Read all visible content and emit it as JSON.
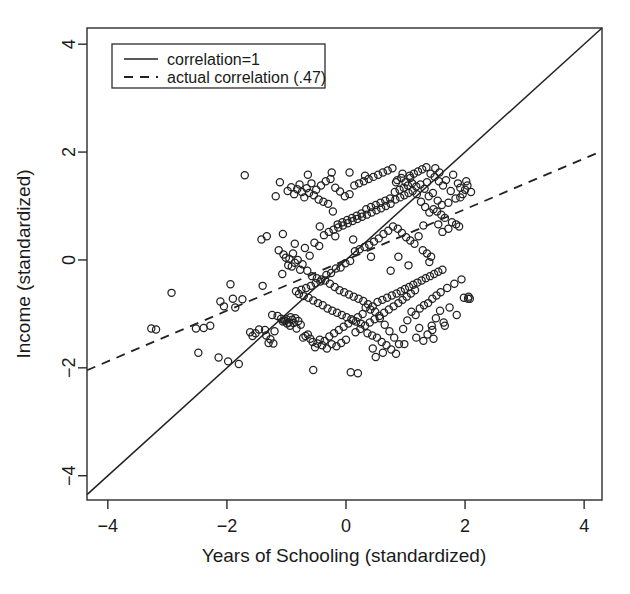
{
  "chart_data": {
    "type": "scatter",
    "title": "",
    "xlabel": "Years of Schooling (standardized)",
    "ylabel": "Income (standardized)",
    "xlim": [
      -4.35,
      4.3
    ],
    "ylim": [
      -4.45,
      4.3
    ],
    "xticks": [
      -4,
      -2,
      0,
      2,
      4
    ],
    "yticks": [
      -4,
      -2,
      0,
      2,
      4
    ],
    "xtick_labels": [
      "−4",
      "−2",
      "0",
      "2",
      "4"
    ],
    "ytick_labels": [
      "−4",
      "−2",
      "0",
      "2",
      "4"
    ],
    "grid": false,
    "legend_position": "top-left",
    "marker": "open-circle",
    "marker_radius": 3.6,
    "point_color": "#222222",
    "n_points": 332,
    "correlation": 0.47,
    "legend": [
      {
        "label": "correlation=1",
        "style": "solid",
        "slope": 1,
        "intercept": 0
      },
      {
        "label": "actual correlation (.47)",
        "style": "dashed",
        "slope": 0.47,
        "intercept": 0
      }
    ],
    "reference_lines": [
      {
        "name": "identity-line",
        "style": "solid",
        "slope": 1,
        "intercept": 0,
        "x_from": -4.35,
        "x_to": 4.3
      },
      {
        "name": "regression-line",
        "style": "dashed",
        "slope": 0.47,
        "intercept": 0,
        "x_from": -4.35,
        "x_to": 4.3
      }
    ],
    "points": [
      [
        -3.27,
        -1.27
      ],
      [
        -3.19,
        -1.29
      ],
      [
        -2.93,
        -0.61
      ],
      [
        -2.52,
        -1.27
      ],
      [
        -2.48,
        -1.72
      ],
      [
        -2.39,
        -1.26
      ],
      [
        -2.28,
        -1.22
      ],
      [
        -2.14,
        -1.81
      ],
      [
        -2.11,
        -0.77
      ],
      [
        -2.05,
        -0.86
      ],
      [
        -1.98,
        -1.88
      ],
      [
        -1.94,
        -0.45
      ],
      [
        -1.9,
        -0.72
      ],
      [
        -1.86,
        -0.88
      ],
      [
        -1.8,
        -1.93
      ],
      [
        -1.74,
        -0.73
      ],
      [
        -1.7,
        1.57
      ],
      [
        -1.61,
        -1.34
      ],
      [
        -1.57,
        -1.41
      ],
      [
        -1.52,
        -1.36
      ],
      [
        -1.46,
        -1.29
      ],
      [
        -1.42,
        0.38
      ],
      [
        -1.4,
        -0.48
      ],
      [
        -1.36,
        -1.3
      ],
      [
        -1.34,
        -1.4
      ],
      [
        -1.33,
        0.44
      ],
      [
        -1.3,
        -1.54
      ],
      [
        -1.27,
        -1.47
      ],
      [
        -1.24,
        -1.02
      ],
      [
        -1.22,
        -1.55
      ],
      [
        -1.2,
        -1.32
      ],
      [
        -1.18,
        1.18
      ],
      [
        -1.15,
        -1.04
      ],
      [
        -1.13,
        0.18
      ],
      [
        -1.11,
        1.44
      ],
      [
        -1.09,
        -1.09
      ],
      [
        -1.07,
        -0.26
      ],
      [
        -1.06,
        -1.14
      ],
      [
        -1.05,
        0.1
      ],
      [
        -1.04,
        -1.12
      ],
      [
        -1.02,
        -1.13
      ],
      [
        -1.01,
        0.04
      ],
      [
        -1.0,
        -1.1
      ],
      [
        -0.99,
        -1.18
      ],
      [
        -0.98,
        1.28
      ],
      [
        -0.97,
        -0.1
      ],
      [
        -0.96,
        -1.16
      ],
      [
        -0.95,
        0.02
      ],
      [
        -0.94,
        -1.22
      ],
      [
        -0.93,
        -1.06
      ],
      [
        -0.92,
        1.35
      ],
      [
        -0.91,
        -0.12
      ],
      [
        -0.9,
        -1.11
      ],
      [
        -0.89,
        0.12
      ],
      [
        -0.88,
        -1.17
      ],
      [
        -0.87,
        1.22
      ],
      [
        -0.86,
        -0.05
      ],
      [
        -0.85,
        -1.08
      ],
      [
        -0.84,
        -0.58
      ],
      [
        -0.83,
        -1.27
      ],
      [
        -0.82,
        1.31
      ],
      [
        -0.81,
        0.0
      ],
      [
        -0.8,
        -1.13
      ],
      [
        -0.79,
        -0.63
      ],
      [
        -0.78,
        1.4
      ],
      [
        -0.77,
        -0.18
      ],
      [
        -0.76,
        -1.2
      ],
      [
        -0.75,
        -0.55
      ],
      [
        -0.74,
        1.26
      ],
      [
        -0.73,
        -0.08
      ],
      [
        -0.72,
        -1.44
      ],
      [
        -0.71,
        -0.67
      ],
      [
        -0.7,
        1.16
      ],
      [
        -0.69,
        0.22
      ],
      [
        -0.68,
        -1.41
      ],
      [
        -0.67,
        -0.52
      ],
      [
        -0.66,
        1.33
      ],
      [
        -0.65,
        -0.2
      ],
      [
        -0.64,
        -1.38
      ],
      [
        -0.63,
        -0.7
      ],
      [
        -0.62,
        1.24
      ],
      [
        -0.61,
        0.08
      ],
      [
        -0.6,
        -1.46
      ],
      [
        -0.59,
        -0.48
      ],
      [
        -0.58,
        1.42
      ],
      [
        -0.57,
        -0.3
      ],
      [
        -0.56,
        -1.52
      ],
      [
        -0.55,
        -0.75
      ],
      [
        -0.54,
        1.2
      ],
      [
        -0.53,
        0.32
      ],
      [
        -0.52,
        -1.62
      ],
      [
        -0.51,
        -0.43
      ],
      [
        -0.5,
        1.3
      ],
      [
        -0.49,
        -0.34
      ],
      [
        -0.48,
        -1.55
      ],
      [
        -0.47,
        -0.8
      ],
      [
        -0.46,
        1.12
      ],
      [
        -0.45,
        0.26
      ],
      [
        -0.44,
        -1.48
      ],
      [
        -0.43,
        -0.4
      ],
      [
        -0.42,
        1.38
      ],
      [
        -0.41,
        -0.36
      ],
      [
        -0.4,
        -1.58
      ],
      [
        -0.39,
        -0.84
      ],
      [
        -0.38,
        1.08
      ],
      [
        -0.37,
        0.46
      ],
      [
        -0.36,
        -1.5
      ],
      [
        -0.35,
        -0.38
      ],
      [
        -0.34,
        1.46
      ],
      [
        -0.33,
        -0.28
      ],
      [
        -0.32,
        -1.64
      ],
      [
        -0.31,
        -0.9
      ],
      [
        -0.3,
        1.04
      ],
      [
        -0.29,
        0.52
      ],
      [
        -0.28,
        -1.42
      ],
      [
        -0.27,
        -0.44
      ],
      [
        -0.26,
        1.5
      ],
      [
        -0.25,
        -0.24
      ],
      [
        -0.24,
        -1.56
      ],
      [
        -0.23,
        -0.94
      ],
      [
        -0.22,
        0.9
      ],
      [
        -0.21,
        0.56
      ],
      [
        -0.2,
        -1.36
      ],
      [
        -0.19,
        -0.5
      ],
      [
        -0.18,
        1.34
      ],
      [
        -0.17,
        -0.16
      ],
      [
        -0.16,
        -1.6
      ],
      [
        -0.15,
        -0.98
      ],
      [
        -0.14,
        0.66
      ],
      [
        -0.13,
        0.6
      ],
      [
        -0.12,
        -1.3
      ],
      [
        -0.11,
        -0.56
      ],
      [
        -0.1,
        1.27
      ],
      [
        -0.09,
        -0.14
      ],
      [
        -0.08,
        -1.54
      ],
      [
        -0.07,
        -1.02
      ],
      [
        -0.06,
        0.7
      ],
      [
        -0.05,
        0.64
      ],
      [
        -0.04,
        -1.24
      ],
      [
        -0.03,
        -0.6
      ],
      [
        -0.02,
        1.18
      ],
      [
        -0.01,
        -0.06
      ],
      [
        0.0,
        -1.48
      ],
      [
        0.01,
        -1.06
      ],
      [
        0.02,
        0.74
      ],
      [
        0.03,
        0.68
      ],
      [
        0.04,
        -1.18
      ],
      [
        0.05,
        -0.64
      ],
      [
        0.06,
        1.22
      ],
      [
        0.07,
        -0.02
      ],
      [
        0.08,
        -2.08
      ],
      [
        0.09,
        -1.1
      ],
      [
        0.1,
        0.78
      ],
      [
        0.11,
        0.72
      ],
      [
        0.12,
        -1.12
      ],
      [
        0.13,
        -0.68
      ],
      [
        0.14,
        1.38
      ],
      [
        0.15,
        0.16
      ],
      [
        0.16,
        -1.34
      ],
      [
        0.17,
        -1.14
      ],
      [
        0.18,
        0.82
      ],
      [
        0.19,
        0.76
      ],
      [
        0.2,
        -1.06
      ],
      [
        0.21,
        -0.72
      ],
      [
        0.22,
        1.42
      ],
      [
        0.23,
        0.2
      ],
      [
        0.24,
        -1.28
      ],
      [
        0.25,
        -1.18
      ],
      [
        0.26,
        0.86
      ],
      [
        0.27,
        0.8
      ],
      [
        0.28,
        -1.0
      ],
      [
        0.29,
        -0.76
      ],
      [
        0.3,
        1.46
      ],
      [
        0.31,
        0.24
      ],
      [
        0.32,
        -1.22
      ],
      [
        0.33,
        -0.88
      ],
      [
        0.34,
        0.94
      ],
      [
        0.35,
        0.84
      ],
      [
        0.36,
        -1.36
      ],
      [
        0.37,
        -0.82
      ],
      [
        0.38,
        1.5
      ],
      [
        0.39,
        0.28
      ],
      [
        0.4,
        -1.16
      ],
      [
        0.41,
        -0.92
      ],
      [
        0.42,
        0.98
      ],
      [
        0.43,
        0.88
      ],
      [
        0.44,
        -1.4
      ],
      [
        0.45,
        -0.86
      ],
      [
        0.46,
        1.54
      ],
      [
        0.47,
        0.34
      ],
      [
        0.48,
        -1.1
      ],
      [
        0.49,
        -0.96
      ],
      [
        0.5,
        1.02
      ],
      [
        0.51,
        0.92
      ],
      [
        0.52,
        -1.44
      ],
      [
        0.53,
        -0.78
      ],
      [
        0.54,
        1.58
      ],
      [
        0.55,
        0.4
      ],
      [
        0.56,
        -1.04
      ],
      [
        0.57,
        -1.08
      ],
      [
        0.58,
        1.06
      ],
      [
        0.59,
        0.96
      ],
      [
        0.6,
        -1.52
      ],
      [
        0.61,
        -0.74
      ],
      [
        0.62,
        1.62
      ],
      [
        0.63,
        0.48
      ],
      [
        0.64,
        -0.98
      ],
      [
        0.65,
        -1.2
      ],
      [
        0.66,
        1.1
      ],
      [
        0.67,
        1.0
      ],
      [
        0.68,
        -1.58
      ],
      [
        0.69,
        -0.7
      ],
      [
        0.7,
        1.66
      ],
      [
        0.71,
        0.54
      ],
      [
        0.72,
        -0.92
      ],
      [
        0.73,
        -1.32
      ],
      [
        0.74,
        1.14
      ],
      [
        0.75,
        1.04
      ],
      [
        0.76,
        -1.66
      ],
      [
        0.77,
        -0.66
      ],
      [
        0.78,
        1.7
      ],
      [
        0.79,
        0.62
      ],
      [
        0.8,
        -0.86
      ],
      [
        0.81,
        -1.44
      ],
      [
        0.82,
        1.26
      ],
      [
        0.83,
        1.12
      ],
      [
        0.84,
        -1.74
      ],
      [
        0.85,
        -0.62
      ],
      [
        0.86,
        1.48
      ],
      [
        0.87,
        0.58
      ],
      [
        0.88,
        -0.8
      ],
      [
        0.89,
        -1.56
      ],
      [
        0.9,
        1.3
      ],
      [
        0.91,
        1.16
      ],
      [
        0.92,
        -0.58
      ],
      [
        0.93,
        1.52
      ],
      [
        0.94,
        0.5
      ],
      [
        0.95,
        -0.74
      ],
      [
        0.96,
        -1.28
      ],
      [
        0.97,
        1.34
      ],
      [
        0.98,
        1.2
      ],
      [
        0.99,
        -0.54
      ],
      [
        1.0,
        1.44
      ],
      [
        1.01,
        0.42
      ],
      [
        1.02,
        -0.68
      ],
      [
        1.03,
        -1.12
      ],
      [
        1.04,
        1.38
      ],
      [
        1.05,
        1.24
      ],
      [
        1.06,
        -0.5
      ],
      [
        1.07,
        1.56
      ],
      [
        1.08,
        0.36
      ],
      [
        1.09,
        -0.62
      ],
      [
        1.1,
        -0.96
      ],
      [
        1.11,
        1.42
      ],
      [
        1.12,
        1.28
      ],
      [
        1.13,
        -0.46
      ],
      [
        1.14,
        1.6
      ],
      [
        1.15,
        0.3
      ],
      [
        1.16,
        -0.56
      ],
      [
        1.17,
        -1.02
      ],
      [
        1.18,
        1.36
      ],
      [
        1.19,
        1.22
      ],
      [
        1.2,
        -0.42
      ],
      [
        1.21,
        1.64
      ],
      [
        1.22,
        0.44
      ],
      [
        1.23,
        -1.26
      ],
      [
        1.24,
        -0.9
      ],
      [
        1.25,
        1.4
      ],
      [
        1.26,
        1.08
      ],
      [
        1.27,
        -0.38
      ],
      [
        1.28,
        1.68
      ],
      [
        1.29,
        0.18
      ],
      [
        1.3,
        -1.5
      ],
      [
        1.31,
        -0.84
      ],
      [
        1.32,
        1.32
      ],
      [
        1.33,
        0.98
      ],
      [
        1.34,
        -0.34
      ],
      [
        1.35,
        1.72
      ],
      [
        1.36,
        0.12
      ],
      [
        1.37,
        -1.38
      ],
      [
        1.38,
        -0.8
      ],
      [
        1.39,
        1.18
      ],
      [
        1.4,
        0.88
      ],
      [
        1.41,
        -0.3
      ],
      [
        1.42,
        1.6
      ],
      [
        1.43,
        0.06
      ],
      [
        1.44,
        -1.22
      ],
      [
        1.45,
        -0.72
      ],
      [
        1.46,
        1.24
      ],
      [
        1.47,
        0.94
      ],
      [
        1.48,
        -0.26
      ],
      [
        1.49,
        1.54
      ],
      [
        1.5,
        1.7
      ],
      [
        1.51,
        -1.08
      ],
      [
        1.52,
        -0.66
      ],
      [
        1.53,
        0.9
      ],
      [
        1.54,
        1.1
      ],
      [
        1.55,
        -0.22
      ],
      [
        1.56,
        1.46
      ],
      [
        1.57,
        1.62
      ],
      [
        1.58,
        -0.94
      ],
      [
        1.59,
        -0.6
      ],
      [
        1.6,
        0.84
      ],
      [
        1.61,
        1.02
      ],
      [
        1.62,
        -0.18
      ],
      [
        1.63,
        1.38
      ],
      [
        1.64,
        -1.16
      ],
      [
        1.66,
        0.78
      ],
      [
        1.68,
        1.48
      ],
      [
        1.7,
        -0.52
      ],
      [
        1.72,
        1.06
      ],
      [
        1.74,
        -0.88
      ],
      [
        1.76,
        1.28
      ],
      [
        1.78,
        0.7
      ],
      [
        1.8,
        1.58
      ],
      [
        1.82,
        -0.44
      ],
      [
        1.84,
        1.14
      ],
      [
        1.86,
        -1.02
      ],
      [
        1.88,
        1.42
      ],
      [
        1.9,
        0.62
      ],
      [
        1.92,
        1.34
      ],
      [
        1.94,
        -0.36
      ],
      [
        1.96,
        1.22
      ],
      [
        1.98,
        -0.7
      ],
      [
        2.0,
        1.3
      ],
      [
        2.02,
        1.46
      ],
      [
        2.04,
        1.38
      ],
      [
        2.06,
        -0.68
      ],
      [
        2.08,
        -0.72
      ],
      [
        2.1,
        1.26
      ],
      [
        1.45,
        -1.3
      ],
      [
        1.55,
        0.66
      ],
      [
        1.3,
        0.64
      ],
      [
        1.18,
        -1.44
      ],
      [
        0.95,
        1.6
      ],
      [
        0.62,
        -1.72
      ],
      [
        0.45,
        -1.64
      ],
      [
        0.2,
        -2.1
      ],
      [
        -0.55,
        -2.04
      ],
      [
        0.88,
        0.06
      ],
      [
        1.62,
        0.52
      ],
      [
        1.4,
        -0.04
      ],
      [
        1.05,
        -0.1
      ],
      [
        0.75,
        -0.2
      ],
      [
        0.5,
        -1.8
      ],
      [
        1.72,
        0.58
      ],
      [
        1.92,
        1.16
      ],
      [
        1.36,
        1.44
      ],
      [
        1.08,
        1.52
      ],
      [
        0.84,
        1.44
      ],
      [
        0.32,
        1.56
      ],
      [
        0.06,
        1.62
      ],
      [
        -0.24,
        1.62
      ],
      [
        -0.64,
        1.58
      ],
      [
        -0.44,
        0.62
      ],
      [
        -0.18,
        0.44
      ],
      [
        0.12,
        0.38
      ],
      [
        0.42,
        0.06
      ],
      [
        -0.86,
        0.3
      ],
      [
        -1.06,
        0.48
      ],
      [
        1.85,
        0.66
      ],
      [
        2.05,
        -0.72
      ],
      [
        1.66,
        -1.22
      ],
      [
        1.47,
        -1.46
      ],
      [
        0.98,
        -1.56
      ]
    ]
  }
}
